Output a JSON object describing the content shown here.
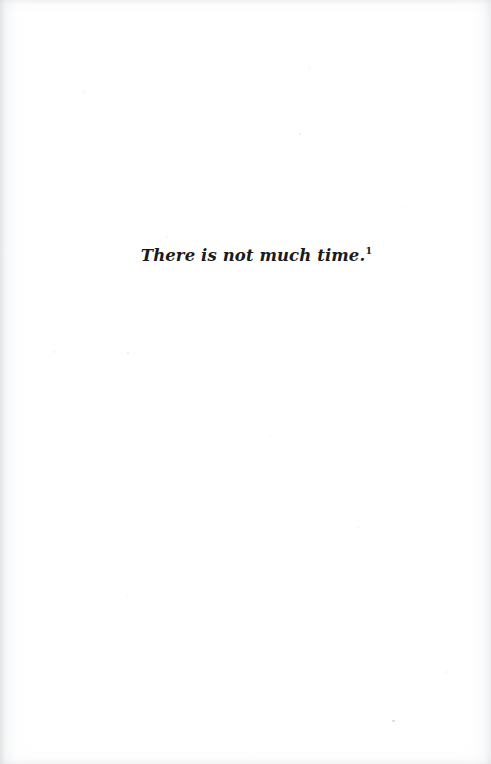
{
  "page": {
    "kind": "scanned-book-page",
    "width": 491,
    "height": 764,
    "background_color": "#fdfdfd",
    "text_color": "#1b1b1d"
  },
  "body": {
    "lines": [
      {
        "text": "There is not much time.",
        "style": "italic",
        "footnote_marker": "1"
      }
    ]
  },
  "artifacts": {
    "specks": [
      "scan-speck-lower-right",
      "scan-speck-mid-left",
      "scan-speck-upper-mid"
    ]
  }
}
